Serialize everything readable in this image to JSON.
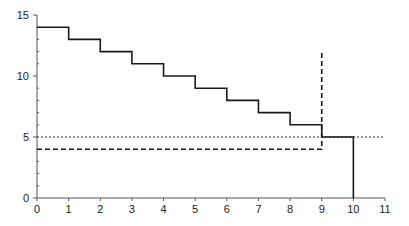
{
  "chart_data": {
    "type": "line",
    "title": "",
    "xlabel": "",
    "ylabel": "",
    "xlim": [
      0,
      11
    ],
    "ylim": [
      0,
      15
    ],
    "x_ticks": [
      0,
      1,
      2,
      3,
      4,
      5,
      6,
      7,
      8,
      9,
      10,
      11
    ],
    "y_ticks": [
      0,
      5,
      10,
      15
    ],
    "y_minor_step": 1,
    "grid": false,
    "legend": null,
    "series": [
      {
        "name": "step-function",
        "style": "solid",
        "kind": "step",
        "points": [
          [
            0,
            14
          ],
          [
            1,
            14
          ],
          [
            1,
            13
          ],
          [
            2,
            13
          ],
          [
            2,
            12
          ],
          [
            3,
            12
          ],
          [
            3,
            11
          ],
          [
            4,
            11
          ],
          [
            4,
            10
          ],
          [
            5,
            10
          ],
          [
            5,
            9
          ],
          [
            6,
            9
          ],
          [
            6,
            8
          ],
          [
            7,
            8
          ],
          [
            7,
            7
          ],
          [
            8,
            7
          ],
          [
            8,
            6
          ],
          [
            9,
            6
          ],
          [
            9,
            5
          ],
          [
            10,
            5
          ],
          [
            10,
            0
          ]
        ]
      },
      {
        "name": "dashed-threshold",
        "style": "dashed",
        "points": [
          [
            0,
            4
          ],
          [
            9,
            4
          ],
          [
            9,
            12
          ]
        ]
      },
      {
        "name": "dotted-reference",
        "style": "dotted",
        "points": [
          [
            0,
            5
          ],
          [
            11,
            5
          ]
        ]
      }
    ]
  },
  "colors": {
    "line": "#1a1a1a",
    "axis": "#555555",
    "background": "#ffffff"
  }
}
